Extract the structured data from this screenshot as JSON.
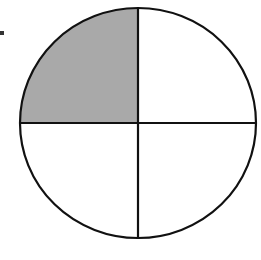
{
  "diagram": {
    "type": "fraction-circle",
    "total_parts": 4,
    "shaded_parts": 1,
    "shaded_quadrant": "top-left",
    "colors": {
      "outline": "#111111",
      "shaded": "#a9a9a9",
      "unshaded": "#ffffff",
      "marker": "#333333"
    }
  }
}
